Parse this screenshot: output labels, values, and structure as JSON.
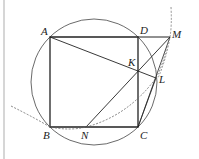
{
  "diagram": {
    "type": "geometry",
    "points": {
      "A": {
        "label": "A",
        "x": 50,
        "y": 37
      },
      "B": {
        "label": "B",
        "x": 50,
        "y": 127
      },
      "C": {
        "label": "C",
        "x": 138,
        "y": 127
      },
      "D": {
        "label": "D",
        "x": 138,
        "y": 37
      },
      "M": {
        "label": "M",
        "x": 170,
        "y": 37
      },
      "K": {
        "label": "K",
        "x": 138,
        "y": 69
      },
      "L": {
        "label": "L",
        "x": 156,
        "y": 78
      },
      "N": {
        "label": "N",
        "x": 86,
        "y": 127
      }
    },
    "labels": {
      "A": "A",
      "B": "B",
      "C": "C",
      "D": "D",
      "M": "M",
      "K": "K",
      "L": "L",
      "N": "N"
    },
    "colors": {
      "stroke": "#333333",
      "dashed": "#666666",
      "rule": "#d6d6d6"
    },
    "elements": [
      "square ABCD",
      "circumcircle of ABCD",
      "segment DM (extension of AD)",
      "segment AL",
      "segment NM",
      "segment CL",
      "segment CM",
      "dashed arc through B, N, L",
      "dashed arc near M"
    ]
  }
}
